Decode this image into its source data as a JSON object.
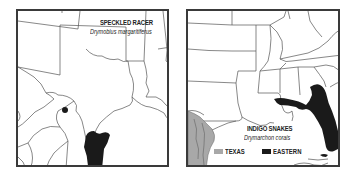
{
  "maps": [
    {
      "id": "speckled-racer",
      "title": "SPECKLED RACER",
      "scientific_name": "Drymobius margaritiferus",
      "range_color": "#1a1a1a",
      "markers": [
        {
          "type": "dot",
          "label": "isolated record"
        }
      ]
    },
    {
      "id": "indigo-snakes",
      "title": "INDIGO SNAKES",
      "scientific_name": "Drymarchon corais",
      "legend": [
        {
          "label": "TEXAS",
          "color": "#a8a8a8"
        },
        {
          "label": "EASTERN",
          "color": "#1a1a1a"
        }
      ]
    }
  ],
  "colors": {
    "frame": "#3a3a3a",
    "boundary": "#555555",
    "background": "#ffffff"
  }
}
